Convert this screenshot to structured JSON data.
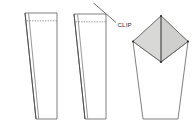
{
  "diagram": {
    "background_color": "#ffffff",
    "stroke_color": "#5a5a5a",
    "dark_stroke_color": "#3a3a3a",
    "shade_fill_left": "#d6d6d4",
    "shade_fill_right": "#cdcdcb",
    "body_fill": "#ffffff",
    "dash_pattern": "1.4 1.2",
    "annotations": {
      "clip_label": "CLIP"
    },
    "figures": [
      {
        "name": "step-1-flat-blank",
        "caption": "",
        "outline": "25,13 57,13 57,119 36,119",
        "seam_outer": "25,13 36,119",
        "seam_inner": "28.5,13.5 38.6,118.6",
        "top_edge": "25,13 57,13",
        "bottom_edge": "36,119 57,119",
        "right_edge": "57,13 57,119",
        "fold_dash": "27,21 57,21"
      },
      {
        "name": "step-2-clip-marked",
        "caption": "CLIP",
        "outline": "74,14 106,14 106,119 85,119",
        "seam_outer": "74,14 85,119",
        "seam_inner": "77.5,14.5 87.6,118.6",
        "top_edge": "74,14 106,14",
        "bottom_edge": "85,119 106,119",
        "right_edge": "106,14 106,119",
        "fold_dash": "76,22 106,22",
        "clip_line": "94,3 116,22",
        "clip_text_pos": "118,25"
      },
      {
        "name": "step-3-opened-gusset",
        "caption": "",
        "body_outline": "133,41 161,16 188,41 178,119 143,119",
        "diamond": "161,16 188,42 161,62 133,42",
        "diamond_center_line": "161,16 161,62",
        "left_side": "133,42 143,119",
        "right_side": "188,42 178,119",
        "bottom_edge": "143,119 178,119",
        "corner_dots": [
          {
            "cx": 161,
            "cy": 16
          },
          {
            "cx": 188,
            "cy": 42
          },
          {
            "cx": 161,
            "cy": 62
          },
          {
            "cx": 133,
            "cy": 42
          }
        ]
      }
    ]
  }
}
